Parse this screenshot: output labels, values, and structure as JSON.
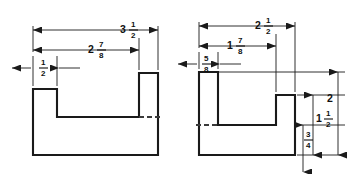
{
  "drawing": {
    "title": "Two-view machine part dimension drawing",
    "units": "inches",
    "background_color": "#ffffff",
    "line_color": "#1a1a1a",
    "hidden_line_color": "#3a3a3a",
    "figures": [
      {
        "id": "left-figure",
        "name": "left-part-profile",
        "description": "U-shaped block, front view, left part",
        "dimensions": [
          {
            "name": "overall-width",
            "label": "3 1/2",
            "whole": "3",
            "numerator": "1",
            "denominator": "2",
            "orientation": "horizontal",
            "position": "top-outer"
          },
          {
            "name": "inner-width",
            "label": "2 7/8",
            "whole": "2",
            "numerator": "7",
            "denominator": "8",
            "orientation": "horizontal",
            "position": "top-middle"
          },
          {
            "name": "left-tab-width",
            "label": "1/2",
            "whole": "",
            "numerator": "1",
            "denominator": "2",
            "orientation": "horizontal",
            "position": "top-inner-left"
          }
        ]
      },
      {
        "id": "right-figure",
        "name": "right-part-profile",
        "description": "U-shaped block, front view, right part with vertical dimensions",
        "dimensions": [
          {
            "name": "overall-width",
            "label": "2 1/2",
            "whole": "2",
            "numerator": "1",
            "denominator": "2",
            "orientation": "horizontal",
            "position": "top-outer"
          },
          {
            "name": "inner-width",
            "label": "1 7/8",
            "whole": "1",
            "numerator": "7",
            "denominator": "8",
            "orientation": "horizontal",
            "position": "top-middle"
          },
          {
            "name": "left-tab-width",
            "label": "5/8",
            "whole": "",
            "numerator": "5",
            "denominator": "8",
            "orientation": "horizontal",
            "position": "top-inner-left"
          },
          {
            "name": "overall-height",
            "label": "2",
            "whole": "2",
            "numerator": "",
            "denominator": "",
            "orientation": "vertical",
            "position": "right-outer"
          },
          {
            "name": "step-height",
            "label": "1 1/2",
            "whole": "1",
            "numerator": "1",
            "denominator": "2",
            "orientation": "vertical",
            "position": "right-middle"
          },
          {
            "name": "base-height",
            "label": "3/4",
            "whole": "",
            "numerator": "3",
            "denominator": "4",
            "orientation": "vertical",
            "position": "right-inner"
          }
        ]
      }
    ]
  }
}
